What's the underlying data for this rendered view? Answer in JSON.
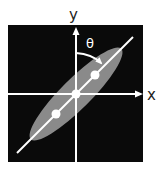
{
  "diagram": {
    "axis_labels": {
      "x": "x",
      "y": "y"
    },
    "angle_label": "θ",
    "colors": {
      "background": "#ffffff",
      "panel": "#0a0a0a",
      "ellipse": "#8a8a8a",
      "lines": "#ffffff",
      "label": "#222222"
    },
    "points": 3
  }
}
